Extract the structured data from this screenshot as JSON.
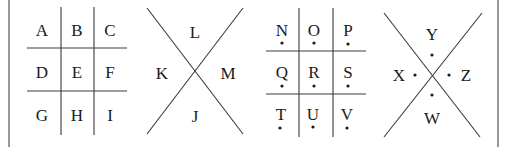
{
  "grid1": {
    "letters": [
      "A",
      "B",
      "C",
      "D",
      "E",
      "F",
      "G",
      "H",
      "I"
    ],
    "dots": false
  },
  "x1": {
    "top": "L",
    "left": "K",
    "right": "M",
    "bottom": "J",
    "dots": false
  },
  "grid2": {
    "letters": [
      "N",
      "O",
      "P",
      "Q",
      "R",
      "S",
      "T",
      "U",
      "V"
    ],
    "dots": true
  },
  "x2": {
    "top": "Y",
    "left": "X",
    "right": "Z",
    "bottom": "W",
    "dots": true
  },
  "colors": {
    "line": "#3a3a3a",
    "text": "#1a1a1a",
    "background": "#ffffff"
  }
}
